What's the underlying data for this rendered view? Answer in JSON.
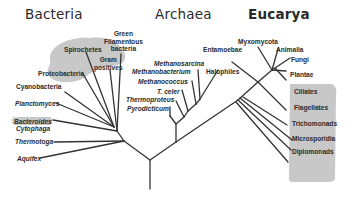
{
  "titles": {
    "bacteria": "Bacteria",
    "archaea": "Archaea",
    "eucarya": "Eucarya"
  },
  "bacteria": {
    "green_filamentous": [
      "Green",
      "Filamentous",
      "bacteria"
    ],
    "spirochetes": "Spirochetes",
    "gram_positives": [
      "Gram",
      "positives"
    ],
    "proteobacteria": "Proteobacteria",
    "cyanobacteria": "Cyanobacteria",
    "planctomyces": "Planctomyces",
    "bacteroides": "Bacteroides",
    "cytophaga": "Cytophaga",
    "thermotoga": "Thermotoga",
    "aquifex": "Aquifex"
  },
  "archaea": {
    "methanosarcina": "Methanosarcina",
    "methanobacterium": "Methanobacterium",
    "methanococcus": "Methanococcus",
    "t_celer": "T. celer",
    "thermoproteus": "Thermoproteus",
    "pyrodicticum": "Pyrodicticum",
    "halophiles": "Halophiles"
  },
  "eucarya": {
    "entamoebae": "Entamoebae",
    "myxomycota": "Myxomycota",
    "animalia": "Animalia",
    "fungi": "Fungi",
    "plantae": "Plantae",
    "ciliates": "Ciliates",
    "flagellates": "Flagellates",
    "trichomonads": "Trichomonads",
    "microsporidia": "Microsporidia",
    "diplomonads": "Diplomonads"
  },
  "colors": {
    "line": "#333333",
    "highlight": "#c8c8c8",
    "text": "#2a2a2a"
  }
}
